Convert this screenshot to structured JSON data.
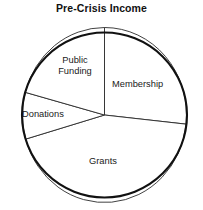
{
  "chart_data": {
    "type": "pie",
    "title": "Pre-Crisis Income",
    "xlabel": "",
    "ylabel": "",
    "legend": "none",
    "grid": false,
    "labels_inside": true,
    "categories": [
      "Membership",
      "Grants",
      "Donations",
      "Public Funding"
    ],
    "values": [
      26.7,
      43.9,
      8.6,
      20.8
    ],
    "units": "percent",
    "slices": [
      {
        "name": "Membership",
        "label": "Membership",
        "value": 26.7,
        "start_angle_deg": 0,
        "end_angle_deg": 96,
        "color": "#ffffff",
        "edge_color": "#2b2b2b"
      },
      {
        "name": "Grants",
        "label": "Grants",
        "value": 43.9,
        "start_angle_deg": 96,
        "end_angle_deg": 254,
        "color": "#ffffff",
        "edge_color": "#2b2b2b"
      },
      {
        "name": "Donations",
        "label": "Donations",
        "value": 8.6,
        "start_angle_deg": 254,
        "end_angle_deg": 285,
        "color": "#ffffff",
        "edge_color": "#2b2b2b"
      },
      {
        "name": "Public Funding",
        "label": "Public\nFunding",
        "value": 20.8,
        "start_angle_deg": 285,
        "end_angle_deg": 360,
        "color": "#ffffff",
        "edge_color": "#2b2b2b"
      }
    ]
  },
  "colors": {
    "background": "#ffffff",
    "outline": "#111111",
    "divider": "#2b2b2b",
    "text": "#1a1a1a"
  }
}
